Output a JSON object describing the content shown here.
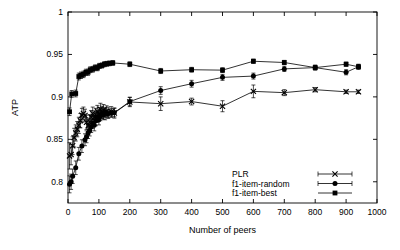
{
  "chart_data": {
    "type": "line",
    "title": "",
    "xlabel": "Number of peers",
    "ylabel": "ATP",
    "xlim": [
      0,
      1000
    ],
    "ylim": [
      0.775,
      1.0
    ],
    "xticks": [
      0,
      100,
      200,
      300,
      400,
      500,
      600,
      700,
      800,
      900,
      1000
    ],
    "xtick_labels": [
      "0",
      "100",
      "200",
      "300",
      "400",
      "500",
      "600",
      "700",
      "800",
      "900",
      "1000"
    ],
    "yticks": [
      0.8,
      0.85,
      0.9,
      0.95,
      1
    ],
    "ytick_labels": [
      "0.8",
      "0.85",
      "0.9",
      "0.95",
      "1"
    ],
    "grid": false,
    "legend_position": "bottom-right",
    "series": [
      {
        "name": "PLR",
        "marker": "x",
        "has_error_bars": true,
        "points": [
          {
            "x": 5,
            "y": 0.8305,
            "err": 0.0155
          },
          {
            "x": 10,
            "y": 0.832,
            "err": 0.012
          },
          {
            "x": 15,
            "y": 0.8425,
            "err": 0.0105
          },
          {
            "x": 20,
            "y": 0.852,
            "err": 0.011
          },
          {
            "x": 25,
            "y": 0.8575,
            "err": 0.0095
          },
          {
            "x": 30,
            "y": 0.862,
            "err": 0.009
          },
          {
            "x": 35,
            "y": 0.8665,
            "err": 0.0095
          },
          {
            "x": 40,
            "y": 0.872,
            "err": 0.0085
          },
          {
            "x": 45,
            "y": 0.8785,
            "err": 0.008
          },
          {
            "x": 50,
            "y": 0.8805,
            "err": 0.0075
          },
          {
            "x": 55,
            "y": 0.878,
            "err": 0.0075
          },
          {
            "x": 60,
            "y": 0.87,
            "err": 0.0085
          },
          {
            "x": 65,
            "y": 0.866,
            "err": 0.009
          },
          {
            "x": 70,
            "y": 0.8705,
            "err": 0.0085
          },
          {
            "x": 75,
            "y": 0.876,
            "err": 0.008
          },
          {
            "x": 80,
            "y": 0.8805,
            "err": 0.0075
          },
          {
            "x": 85,
            "y": 0.8755,
            "err": 0.008
          },
          {
            "x": 90,
            "y": 0.879,
            "err": 0.0075
          },
          {
            "x": 95,
            "y": 0.883,
            "err": 0.007
          },
          {
            "x": 100,
            "y": 0.88,
            "err": 0.0075
          },
          {
            "x": 105,
            "y": 0.8855,
            "err": 0.007
          },
          {
            "x": 110,
            "y": 0.882,
            "err": 0.007
          },
          {
            "x": 115,
            "y": 0.8845,
            "err": 0.0065
          },
          {
            "x": 120,
            "y": 0.88,
            "err": 0.007
          },
          {
            "x": 125,
            "y": 0.883,
            "err": 0.0065
          },
          {
            "x": 130,
            "y": 0.8815,
            "err": 0.0065
          },
          {
            "x": 140,
            "y": 0.8825,
            "err": 0.006
          },
          {
            "x": 150,
            "y": 0.881,
            "err": 0.006
          },
          {
            "x": 200,
            "y": 0.894,
            "err": 0.0055
          },
          {
            "x": 300,
            "y": 0.892,
            "err": 0.008
          },
          {
            "x": 400,
            "y": 0.8945,
            "err": 0.004
          },
          {
            "x": 500,
            "y": 0.889,
            "err": 0.0065
          },
          {
            "x": 600,
            "y": 0.9065,
            "err": 0.0075
          },
          {
            "x": 700,
            "y": 0.905,
            "err": 0.0035
          },
          {
            "x": 800,
            "y": 0.9085,
            "err": 0.0025
          },
          {
            "x": 900,
            "y": 0.906,
            "err": 0.002
          },
          {
            "x": 940,
            "y": 0.906,
            "err": 0.002
          }
        ]
      },
      {
        "name": "f1-item-random",
        "marker": "circle",
        "has_error_bars": true,
        "points": [
          {
            "x": 5,
            "y": 0.797,
            "err": 0.01
          },
          {
            "x": 10,
            "y": 0.8,
            "err": 0.009
          },
          {
            "x": 15,
            "y": 0.8065,
            "err": 0.0085
          },
          {
            "x": 25,
            "y": 0.8165,
            "err": 0.008
          },
          {
            "x": 35,
            "y": 0.833,
            "err": 0.0075
          },
          {
            "x": 45,
            "y": 0.842,
            "err": 0.0075
          },
          {
            "x": 55,
            "y": 0.8495,
            "err": 0.007
          },
          {
            "x": 60,
            "y": 0.853,
            "err": 0.007
          },
          {
            "x": 65,
            "y": 0.8575,
            "err": 0.0065
          },
          {
            "x": 70,
            "y": 0.8605,
            "err": 0.0065
          },
          {
            "x": 75,
            "y": 0.8645,
            "err": 0.0065
          },
          {
            "x": 80,
            "y": 0.869,
            "err": 0.006
          },
          {
            "x": 85,
            "y": 0.8665,
            "err": 0.0065
          },
          {
            "x": 90,
            "y": 0.872,
            "err": 0.006
          },
          {
            "x": 95,
            "y": 0.876,
            "err": 0.006
          },
          {
            "x": 100,
            "y": 0.873,
            "err": 0.006
          },
          {
            "x": 105,
            "y": 0.8775,
            "err": 0.0055
          },
          {
            "x": 110,
            "y": 0.88,
            "err": 0.0055
          },
          {
            "x": 115,
            "y": 0.879,
            "err": 0.0055
          },
          {
            "x": 120,
            "y": 0.8815,
            "err": 0.0055
          },
          {
            "x": 130,
            "y": 0.88,
            "err": 0.005
          },
          {
            "x": 140,
            "y": 0.881,
            "err": 0.005
          },
          {
            "x": 150,
            "y": 0.8815,
            "err": 0.005
          },
          {
            "x": 200,
            "y": 0.8945,
            "err": 0.005
          },
          {
            "x": 300,
            "y": 0.9075,
            "err": 0.0045
          },
          {
            "x": 400,
            "y": 0.9155,
            "err": 0.004
          },
          {
            "x": 500,
            "y": 0.923,
            "err": 0.0035
          },
          {
            "x": 600,
            "y": 0.9245,
            "err": 0.0035
          },
          {
            "x": 700,
            "y": 0.933,
            "err": 0.003
          },
          {
            "x": 800,
            "y": 0.9345,
            "err": 0.003
          },
          {
            "x": 900,
            "y": 0.929,
            "err": 0.003
          },
          {
            "x": 940,
            "y": 0.9355,
            "err": 0.003
          }
        ]
      },
      {
        "name": "f1-item-best",
        "marker": "square",
        "has_error_bars": true,
        "points": [
          {
            "x": 5,
            "y": 0.8825,
            "err": 0.0045
          },
          {
            "x": 12,
            "y": 0.9035,
            "err": 0.004
          },
          {
            "x": 25,
            "y": 0.904,
            "err": 0.004
          },
          {
            "x": 35,
            "y": 0.924,
            "err": 0.004
          },
          {
            "x": 42,
            "y": 0.9255,
            "err": 0.0038
          },
          {
            "x": 50,
            "y": 0.9265,
            "err": 0.0038
          },
          {
            "x": 58,
            "y": 0.929,
            "err": 0.0036
          },
          {
            "x": 65,
            "y": 0.929,
            "err": 0.0036
          },
          {
            "x": 72,
            "y": 0.932,
            "err": 0.0034
          },
          {
            "x": 80,
            "y": 0.9325,
            "err": 0.0034
          },
          {
            "x": 88,
            "y": 0.9345,
            "err": 0.0032
          },
          {
            "x": 95,
            "y": 0.934,
            "err": 0.0032
          },
          {
            "x": 102,
            "y": 0.9365,
            "err": 0.003
          },
          {
            "x": 110,
            "y": 0.937,
            "err": 0.003
          },
          {
            "x": 118,
            "y": 0.9385,
            "err": 0.003
          },
          {
            "x": 126,
            "y": 0.939,
            "err": 0.0028
          },
          {
            "x": 134,
            "y": 0.9395,
            "err": 0.0028
          },
          {
            "x": 145,
            "y": 0.94,
            "err": 0.0028
          },
          {
            "x": 200,
            "y": 0.9385,
            "err": 0.0028
          },
          {
            "x": 300,
            "y": 0.9305,
            "err": 0.003
          },
          {
            "x": 400,
            "y": 0.932,
            "err": 0.0028
          },
          {
            "x": 500,
            "y": 0.9315,
            "err": 0.0028
          },
          {
            "x": 600,
            "y": 0.942,
            "err": 0.0025
          },
          {
            "x": 700,
            "y": 0.9405,
            "err": 0.0025
          },
          {
            "x": 800,
            "y": 0.9345,
            "err": 0.0025
          },
          {
            "x": 900,
            "y": 0.9385,
            "err": 0.0025
          },
          {
            "x": 940,
            "y": 0.9355,
            "err": 0.0025
          }
        ]
      }
    ]
  },
  "legend": {
    "entries": [
      {
        "label": "PLR",
        "marker": "x"
      },
      {
        "label": "f1-item-random",
        "marker": "circle"
      },
      {
        "label": "f1-item-best",
        "marker": "square"
      }
    ]
  }
}
